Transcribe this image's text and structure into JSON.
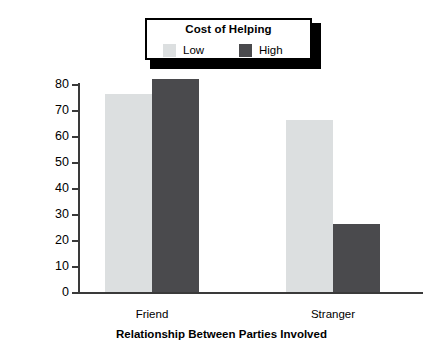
{
  "chart_data": {
    "type": "bar",
    "title": "",
    "xlabel": "Relationship Between Parties Involved",
    "ylabel": "Percentage Seeking Help",
    "categories": [
      "Friend",
      "Stranger"
    ],
    "ylim": [
      0,
      80
    ],
    "yticks": [
      80,
      70,
      60,
      50,
      40,
      30,
      20,
      10,
      0
    ],
    "ytick_labels": [
      "80",
      "70",
      "60",
      "50",
      "40",
      "30",
      "20",
      "10",
      "0"
    ],
    "grid": false,
    "legend_position": "top-center",
    "legend_title": "Cost of Helping",
    "series": [
      {
        "name": "Low",
        "color": "#dcdfe0",
        "values": [
          76,
          66
        ]
      },
      {
        "name": "High",
        "color": "#4a4a4d",
        "values": [
          82,
          26
        ]
      }
    ]
  },
  "legend": {
    "title": "Cost of Helping",
    "entries": [
      {
        "label": "Low",
        "swatch": "legend-swatch-low"
      },
      {
        "label": "High",
        "swatch": "legend-swatch-high"
      }
    ]
  },
  "colors": {
    "low": "#dcdfe0",
    "high": "#4a4a4d",
    "axis": "#3a3a3a",
    "text": "#000000",
    "background": "#ffffff"
  }
}
